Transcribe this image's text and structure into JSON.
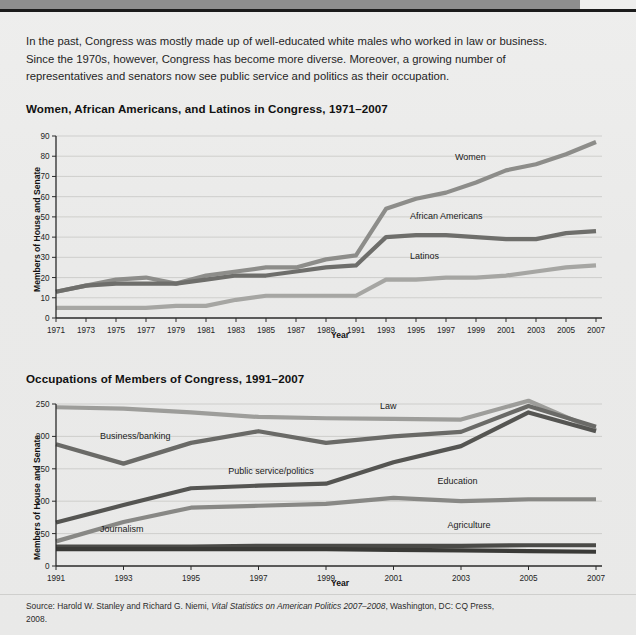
{
  "header": {
    "bar_color": "#8e8e8e",
    "rule_color": "#1c1c1c"
  },
  "intro": {
    "paragraph": "In the past, Congress was mostly made up of well-educated white males who worked in law or business. Since the 1970s, however, Congress has become more diverse. Moreover, a growing number of representatives and senators now see public service and politics as their occupation."
  },
  "figure1": {
    "title": "Women, African Americans, and Latinos in Congress, 1971–2007",
    "ylabel": "Members of House and Senate",
    "xlabel": "Year"
  },
  "figure2": {
    "title": "Occupations of Members of Congress, 1991–2007",
    "ylabel": "Members of House and Senate",
    "xlabel": "Year"
  },
  "source": {
    "line1_pre": "Source: Harold W. Stanley and Richard G. Niemi, ",
    "line1_italic": "Vital Statistics on American Politics 2007–2008",
    "line1_post": ",",
    "line2": "Washington, DC: CQ Press, 2008."
  },
  "chart_data": [
    {
      "type": "line",
      "title": "Women, African Americans, and Latinos in Congress, 1971–2007",
      "xlabel": "Year",
      "ylabel": "Members of House and Senate",
      "x": [
        1971,
        1973,
        1975,
        1977,
        1979,
        1981,
        1983,
        1985,
        1987,
        1989,
        1991,
        1993,
        1995,
        1997,
        1999,
        2001,
        2003,
        2005,
        2007
      ],
      "xticks": [
        "1971",
        "1973",
        "1975",
        "1977",
        "1979",
        "1981",
        "1983",
        "1985",
        "1987",
        "1989",
        "1991",
        "1993",
        "1995",
        "1997",
        "1999",
        "2001",
        "2003",
        "2005",
        "2007"
      ],
      "yticks": [
        0,
        10,
        20,
        30,
        40,
        50,
        60,
        70,
        80,
        90
      ],
      "ylim": [
        0,
        90
      ],
      "xlim": [
        1971,
        2007
      ],
      "grid": true,
      "legend": "inline-labels",
      "series": [
        {
          "name": "Women",
          "color": "#8d8d8a",
          "width": 4.2,
          "values": [
            13,
            16,
            19,
            20,
            17,
            21,
            23,
            25,
            25,
            29,
            31,
            54,
            59,
            62,
            67,
            73,
            76,
            81,
            87
          ]
        },
        {
          "name": "African Americans",
          "color": "#6e6e6b",
          "width": 4.2,
          "values": [
            13,
            16,
            17,
            17,
            17,
            19,
            21,
            21,
            23,
            25,
            26,
            40,
            41,
            41,
            40,
            39,
            39,
            42,
            43
          ]
        },
        {
          "name": "Latinos",
          "color": "#a6a6a3",
          "width": 4.2,
          "values": [
            5,
            5,
            5,
            5,
            6,
            6,
            9,
            11,
            11,
            11,
            11,
            19,
            19,
            20,
            20,
            21,
            23,
            25,
            26
          ]
        }
      ]
    },
    {
      "type": "line",
      "title": "Occupations of Members of Congress, 1991–2007",
      "xlabel": "Year",
      "ylabel": "Members of House and Senate",
      "x": [
        1991,
        1993,
        1995,
        1997,
        1999,
        2001,
        2003,
        2005,
        2007
      ],
      "xticks": [
        "1991",
        "1993",
        "1995",
        "1997",
        "1999",
        "2001",
        "2003",
        "2005",
        "2007"
      ],
      "yticks": [
        0,
        50,
        100,
        150,
        200,
        250
      ],
      "ylim": [
        0,
        250
      ],
      "xlim": [
        1991,
        2007
      ],
      "grid": true,
      "legend": "inline-labels",
      "series": [
        {
          "name": "Law",
          "color": "#9d9d9a",
          "width": 4.2,
          "values": [
            245,
            243,
            237,
            230,
            228,
            227,
            226,
            255,
            210
          ]
        },
        {
          "name": "Public service/politics",
          "color": "#6a6a67",
          "width": 4.2,
          "values": [
            188,
            158,
            190,
            208,
            190,
            200,
            207,
            247,
            215
          ]
        },
        {
          "name": "Business/banking",
          "color": "#555552",
          "width": 4.2,
          "values": [
            67,
            94,
            120,
            124,
            127,
            160,
            185,
            237,
            208
          ]
        },
        {
          "name": "Education",
          "color": "#888885",
          "width": 4.2,
          "values": [
            38,
            68,
            90,
            93,
            96,
            105,
            100,
            103,
            103
          ]
        },
        {
          "name": "Journalism",
          "color": "#4a4a47",
          "width": 4.2,
          "values": [
            30,
            30,
            30,
            31,
            31,
            31,
            31,
            32,
            32
          ]
        },
        {
          "name": "Agriculture",
          "color": "#3a3a37",
          "width": 4.2,
          "values": [
            26,
            26,
            26,
            26,
            26,
            25,
            24,
            23,
            22
          ]
        }
      ],
      "annotations": [
        {
          "text": "Law",
          "x": 2000.6,
          "y": 243
        },
        {
          "text": "Public service/politics",
          "x": 1996.1,
          "y": 142
        },
        {
          "text": "Business/banking",
          "x": 1992.3,
          "y": 196
        },
        {
          "text": "Education",
          "x": 2002.3,
          "y": 126
        },
        {
          "text": "Journalism",
          "x": 1992.3,
          "y": 52
        },
        {
          "text": "Agriculture",
          "x": 2002.6,
          "y": 58
        }
      ]
    }
  ],
  "chart1_annotations": [
    {
      "text": "Women",
      "x": 1997.6,
      "y": 78
    },
    {
      "text": "African Americans",
      "x": 1994.6,
      "y": 49
    },
    {
      "text": "Latinos",
      "x": 1994.6,
      "y": 29
    }
  ]
}
